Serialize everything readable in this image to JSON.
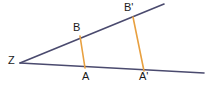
{
  "figure": {
    "width": 217,
    "height": 87,
    "background_color": "#ffffff",
    "ray_color": "#4a4a6e",
    "segment_color": "#e8a040",
    "label_color": "#1a1a1a",
    "ray_stroke_width": 1.6,
    "segment_stroke_width": 1.6
  },
  "labels": {
    "vertex": "Z",
    "b": "B",
    "b_prime": "B'",
    "a": "A",
    "a_prime": "A'"
  },
  "chart_data": {
    "type": "diagram",
    "points": [
      {
        "name": "Z",
        "x": 20,
        "y": 63,
        "label_position": "left"
      },
      {
        "name": "B",
        "x": 80,
        "y": 36,
        "label_position": "above"
      },
      {
        "name": "B'",
        "x": 133,
        "y": 17,
        "label_position": "above"
      },
      {
        "name": "A",
        "x": 85,
        "y": 68,
        "label_position": "below"
      },
      {
        "name": "A'",
        "x": 144,
        "y": 71,
        "label_position": "below"
      }
    ],
    "rays": [
      {
        "name": "upper-ray",
        "from": [
          20,
          63
        ],
        "to": [
          164,
          4
        ],
        "color": "#4a4a6e"
      },
      {
        "name": "lower-ray",
        "from": [
          20,
          63
        ],
        "to": [
          204,
          73
        ],
        "color": "#4a4a6e"
      }
    ],
    "segments": [
      {
        "name": "segment-BA",
        "from": "B",
        "to": "A",
        "color": "#e8a040"
      },
      {
        "name": "segment-BpAp",
        "from": "B'",
        "to": "A'",
        "color": "#e8a040"
      }
    ]
  }
}
